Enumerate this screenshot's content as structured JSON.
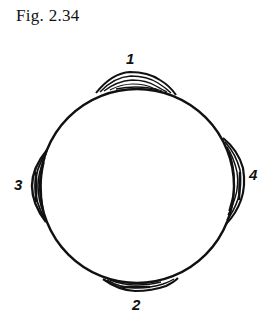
{
  "figure": {
    "caption": "Fig. 2.34",
    "circle": {
      "cx": 137,
      "cy": 186,
      "r": 97,
      "stroke": "#111111"
    },
    "deposits": [
      {
        "id": "1",
        "label": "1",
        "position": "top"
      },
      {
        "id": "2",
        "label": "2",
        "position": "bottom"
      },
      {
        "id": "3",
        "label": "3",
        "position": "left"
      },
      {
        "id": "4",
        "label": "4",
        "position": "right"
      }
    ]
  }
}
